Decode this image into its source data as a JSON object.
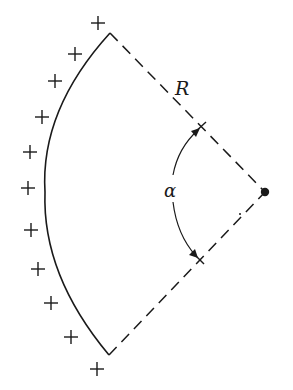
{
  "diagram": {
    "labels": {
      "radius": "R",
      "angle": "α"
    },
    "geometry": {
      "center": [
        265,
        192
      ],
      "top_vertex": [
        110,
        33
      ],
      "bottom_vertex": [
        109,
        355
      ],
      "arc_leftmost": [
        45,
        190
      ],
      "angle_tick_upper": [
        200,
        128
      ],
      "angle_tick_lower": [
        198,
        258
      ]
    },
    "charges": {
      "symbol": "+",
      "count": 11,
      "positions": [
        [
          98,
          23
        ],
        [
          75,
          54
        ],
        [
          55,
          81
        ],
        [
          42,
          117
        ],
        [
          30,
          152
        ],
        [
          28,
          188
        ],
        [
          31,
          230
        ],
        [
          38,
          269
        ],
        [
          51,
          303
        ],
        [
          71,
          337
        ],
        [
          97,
          369
        ]
      ]
    },
    "colors": {
      "ink": "#1a1a1a",
      "background": "#ffffff"
    }
  }
}
